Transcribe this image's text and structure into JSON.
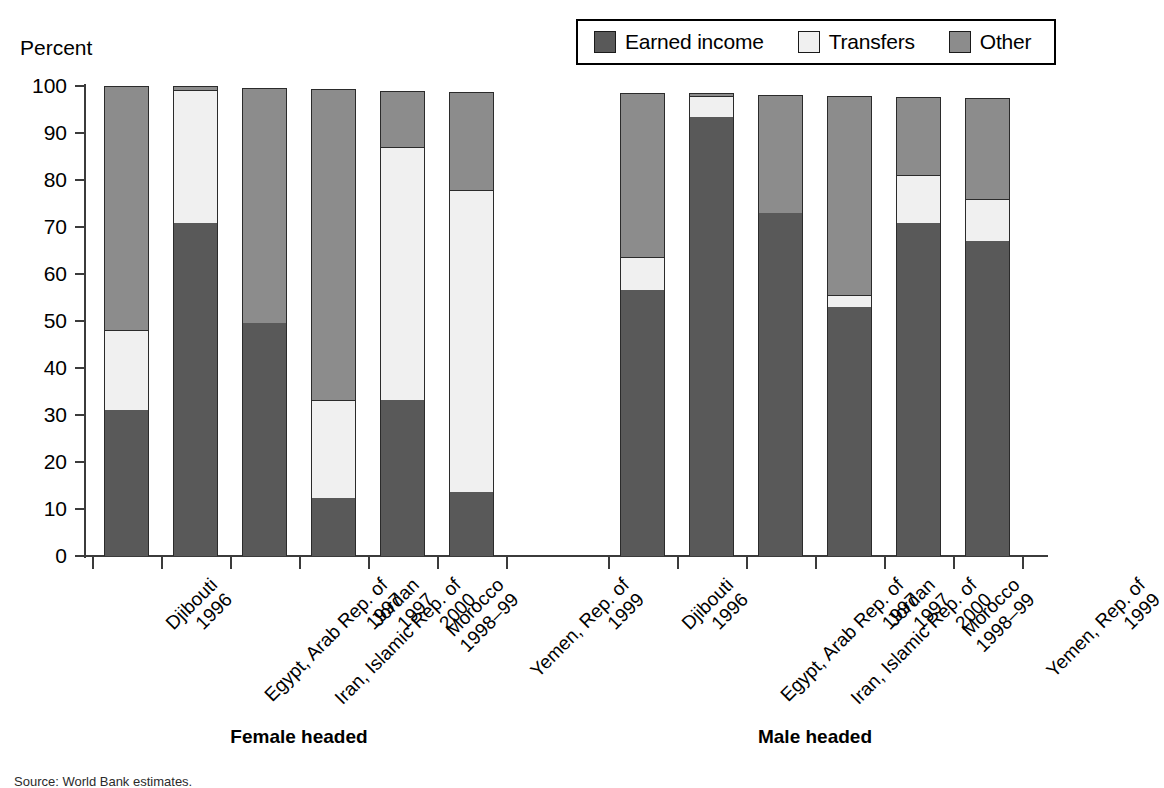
{
  "axis": {
    "ylabel": "Percent",
    "yticks": [
      "100",
      "90",
      "80",
      "70",
      "60",
      "50",
      "40",
      "30",
      "20",
      "10",
      "0"
    ]
  },
  "legend": {
    "items": [
      {
        "label": "Earned income",
        "color": "#595959"
      },
      {
        "label": "Transfers",
        "color": "#f0f0f0"
      },
      {
        "label": "Other",
        "color": "#8c8c8c"
      }
    ]
  },
  "groups": [
    {
      "title": "Female headed"
    },
    {
      "title": "Male headed"
    }
  ],
  "categories": [
    {
      "name": "Djibouti",
      "year": "1996"
    },
    {
      "name": "Egypt, Arab Rep. of",
      "year": "1997"
    },
    {
      "name": "Iran, Islamic Rep. of",
      "year": "2000"
    },
    {
      "name": "Jordan",
      "year": "1997"
    },
    {
      "name": "Morocco",
      "year": "1998–99"
    },
    {
      "name": "Yemen, Rep. of",
      "year": "1999"
    }
  ],
  "source": "Source: World Bank estimates.",
  "chart_data": {
    "type": "bar",
    "title": "",
    "subtitle": "",
    "xlabel": "",
    "ylabel": "Percent",
    "ylim": [
      0,
      100
    ],
    "grid": false,
    "stacked": true,
    "legend_position": "top-right",
    "groups": [
      "Female headed",
      "Male headed"
    ],
    "categories": [
      "Djibouti 1996",
      "Egypt, Arab Rep. of 1997",
      "Iran, Islamic Rep. of 2000",
      "Jordan 1997",
      "Morocco 1998–99",
      "Yemen, Rep. of 1999"
    ],
    "series": [
      {
        "name": "Earned income",
        "color": "#595959"
      },
      {
        "name": "Transfers",
        "color": "#f0f0f0"
      },
      {
        "name": "Other",
        "color": "#8c8c8c"
      }
    ],
    "data": {
      "Female headed": {
        "Earned income": [
          31.0,
          70.8,
          49.5,
          12.4,
          33.2,
          13.7
        ],
        "Transfers": [
          17.0,
          28.4,
          0.0,
          20.7,
          53.8,
          64.1
        ],
        "Other": [
          52.0,
          0.8,
          50.0,
          66.2,
          12.0,
          21.0
        ]
      },
      "Male headed": {
        "Earned income": [
          56.5,
          93.4,
          73.0,
          53.0,
          70.8,
          67.0
        ],
        "Transfers": [
          7.2,
          4.4,
          0.0,
          2.5,
          10.2,
          9.0
        ],
        "Other": [
          34.9,
          0.7,
          25.0,
          42.3,
          16.6,
          21.4
        ]
      }
    },
    "totals": {
      "Female headed": [
        100.0,
        100.0,
        99.5,
        99.3,
        99.0,
        98.8
      ],
      "Male headed": [
        98.6,
        98.5,
        98.0,
        97.8,
        97.6,
        97.4
      ]
    }
  }
}
